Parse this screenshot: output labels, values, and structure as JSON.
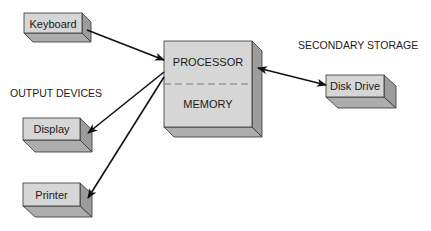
{
  "diagram": {
    "labels": {
      "output_devices": "OUTPUT DEVICES",
      "secondary_storage": "SECONDARY STORAGE"
    },
    "nodes": {
      "keyboard": {
        "label": "Keyboard"
      },
      "processor": {
        "label": "PROCESSOR"
      },
      "memory": {
        "label": "MEMORY"
      },
      "disk_drive": {
        "label": "Disk Drive"
      },
      "display": {
        "label": "Display"
      },
      "printer": {
        "label": "Printer"
      }
    },
    "edges": [
      {
        "from": "Keyboard",
        "to": "Processor",
        "direction": "one-way"
      },
      {
        "from": "Processor",
        "to": "Display",
        "direction": "one-way"
      },
      {
        "from": "Processor",
        "to": "Printer",
        "direction": "one-way"
      },
      {
        "from": "Processor",
        "to": "Disk Drive",
        "direction": "two-way"
      }
    ],
    "colors": {
      "front": "#d6d6d6",
      "side": "#9c9c9c",
      "bottom": "#adadad",
      "edge": "#333333",
      "arrow": "#111111",
      "divider": "#7a7a7a"
    }
  }
}
